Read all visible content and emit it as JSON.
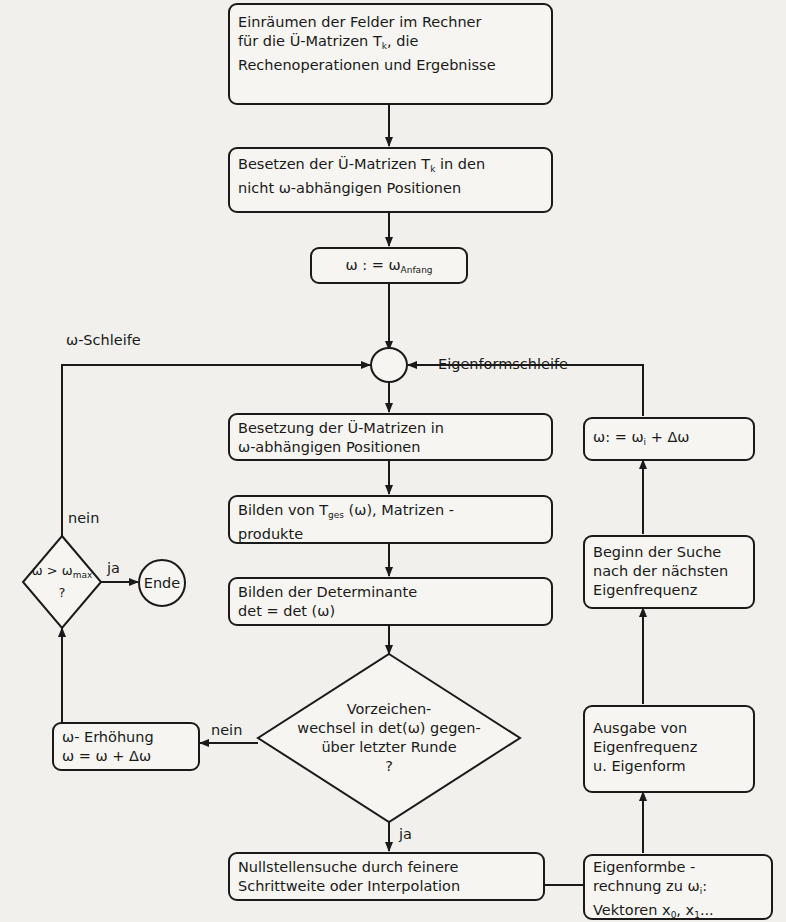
{
  "diagram": {
    "type": "flowchart",
    "language": "de",
    "boxes": {
      "b1": {
        "lines": [
          "Einräumen der Felder im Rechner",
          "für die Ü-Matrizen T",
          "Rechenoperationen und Ergebnisse"
        ],
        "sub1": "k",
        "tail1": ", die"
      },
      "b2": {
        "lines": [
          "Besetzen der Ü-Matrizen T",
          "nicht ω-abhängigen Positionen"
        ],
        "sub0": "k",
        "tail0": " in den"
      },
      "b3": {
        "lhs": "ω : = ω",
        "sub": "Anfang"
      },
      "b4": {
        "lines": [
          "Besetzung der Ü-Matrizen in",
          "ω-abhängigen Positionen"
        ]
      },
      "b5": {
        "line0a": "Bilden von T",
        "sub0": "ges",
        "line0b": " (ω), Matrizen -",
        "line1": "produkte"
      },
      "b6": {
        "lines": [
          "Bilden der Determinante",
          "det  =  det (ω)"
        ]
      },
      "b7": {
        "lines": [
          "Nullstellensuche durch feinere",
          "Schrittweite oder Interpolation"
        ]
      },
      "b8": {
        "lines": [
          "ω- Erhöhung",
          "ω = ω + Δω"
        ]
      },
      "b9": {
        "lhs": "ω: =  ω",
        "sub": "i",
        "rhs": "  + Δω"
      },
      "b10": {
        "lines": [
          "Beginn der Suche",
          "nach der nächsten",
          "Eigenfrequenz"
        ]
      },
      "b11": {
        "lines": [
          "Ausgabe von",
          "Eigenfrequenz",
          "u. Eigenform"
        ]
      },
      "b12": {
        "line0": "Eigenformbe -",
        "line1a": "rechnung zu ω",
        "sub1": "i",
        "line1b": ":",
        "line2a": "Vektoren x",
        "sub2a": "0",
        "line2b": ", x",
        "sub2b": "1",
        "line2c": "..."
      }
    },
    "decisions": {
      "d1": {
        "lines": [
          "Vorzeichen-",
          "wechsel in det(ω) gegen-",
          "über letzter Runde",
          "?"
        ]
      },
      "d2": {
        "lhs": "ω > ω",
        "sub": "max",
        "q": "?"
      }
    },
    "terminal": {
      "end_label": "Ende"
    },
    "labels": {
      "omega_loop": "ω-Schleife",
      "eigenform_loop": "Eigenformschleife",
      "nein_left": "nein",
      "ja_end": "ja",
      "nein_d1": "nein",
      "ja_d1": "ja"
    },
    "colors": {
      "ink": "#1a1a1a",
      "paper": "#f1f0ec"
    }
  }
}
